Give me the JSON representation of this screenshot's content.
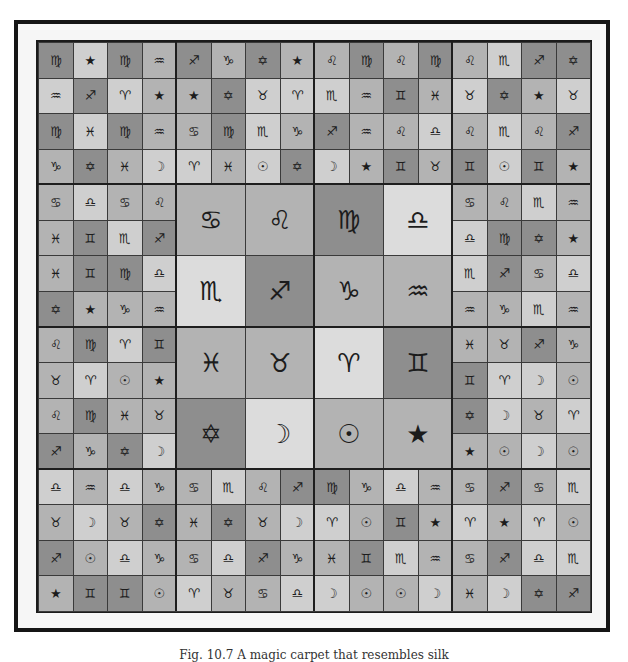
{
  "figure": {
    "credit": "Magick Carpet III   LS  11-03",
    "caption": "Fig. 10.7  A magic carpet that resembles silk"
  },
  "symbols": {
    "aries": "♈",
    "taurus": "♉",
    "gemini": "♊",
    "cancer": "♋",
    "leo": "♌",
    "virgo": "♍",
    "libra": "♎",
    "scorpio": "♏",
    "sagittarius": "♐",
    "capricorn": "♑",
    "aquarius": "♒",
    "pisces": "♓",
    "sun": "☉",
    "moon": "☽",
    "star": "★",
    "hexagram": "✡"
  },
  "grid": {
    "columns": 16,
    "rows": 16,
    "cells": [
      [
        "virgo:dark",
        "star:light",
        "virgo:dark",
        "aquarius:mid",
        "sagittarius:dark",
        "capricorn:mid",
        "hexagram:dark",
        "star:mid",
        "leo:mid",
        "virgo:dark",
        "leo:mid",
        "virgo:dark",
        "leo:mid",
        "scorpio:light",
        "sagittarius:dark",
        "hexagram:dark"
      ],
      [
        "aquarius:light",
        "sagittarius:dark",
        "aries:light",
        "star:mid",
        "star:mid",
        "hexagram:dark",
        "taurus:light",
        "aries:light",
        "scorpio:light",
        "aquarius:mid",
        "gemini:dark",
        "pisces:mid",
        "taurus:light",
        "hexagram:dark",
        "star:mid",
        "taurus:light"
      ],
      [
        "virgo:dark",
        "pisces:light",
        "virgo:dark",
        "aquarius:mid",
        "cancer:mid",
        "virgo:dark",
        "scorpio:light",
        "capricorn:mid",
        "sagittarius:dark",
        "aquarius:mid",
        "leo:mid",
        "libra:light",
        "leo:mid",
        "scorpio:light",
        "leo:mid",
        "sagittarius:dark"
      ],
      [
        "capricorn:mid",
        "hexagram:dark",
        "pisces:mid",
        "moon:light",
        "aries:light",
        "pisces:mid",
        "sun:light",
        "hexagram:dark",
        "moon:light",
        "star:mid",
        "gemini:dark",
        "taurus:mid",
        "gemini:dark",
        "sun:light",
        "gemini:dark",
        "star:mid"
      ],
      [
        "cancer:mid",
        "libra:light",
        "cancer:mid",
        "leo:mid",
        "",
        "",
        "",
        "",
        "",
        "",
        "",
        "",
        "cancer:mid",
        "leo:mid",
        "scorpio:light",
        "aquarius:mid"
      ],
      [
        "pisces:mid",
        "gemini:dark",
        "scorpio:light",
        "sagittarius:dark",
        "",
        "",
        "",
        "",
        "",
        "",
        "",
        "",
        "libra:light",
        "virgo:dark",
        "hexagram:dark",
        "star:mid"
      ],
      [
        "pisces:mid",
        "gemini:dark",
        "virgo:dark",
        "libra:light",
        "",
        "",
        "",
        "",
        "",
        "",
        "",
        "",
        "scorpio:light",
        "sagittarius:dark",
        "cancer:mid",
        "libra:light"
      ],
      [
        "hexagram:dark",
        "star:mid",
        "capricorn:mid",
        "aquarius:mid",
        "",
        "",
        "",
        "",
        "",
        "",
        "",
        "",
        "aquarius:mid",
        "capricorn:mid",
        "scorpio:light",
        "aquarius:mid"
      ],
      [
        "leo:mid",
        "virgo:dark",
        "aries:light",
        "gemini:dark",
        "",
        "",
        "",
        "",
        "",
        "",
        "",
        "",
        "pisces:mid",
        "taurus:mid",
        "sagittarius:dark",
        "capricorn:mid"
      ],
      [
        "taurus:mid",
        "aries:light",
        "sun:mid",
        "star:mid",
        "",
        "",
        "",
        "",
        "",
        "",
        "",
        "",
        "gemini:dark",
        "aries:light",
        "moon:light",
        "sun:mid"
      ],
      [
        "leo:mid",
        "virgo:dark",
        "pisces:mid",
        "taurus:mid",
        "",
        "",
        "",
        "",
        "",
        "",
        "",
        "",
        "hexagram:dark",
        "moon:light",
        "taurus:mid",
        "aries:light"
      ],
      [
        "sagittarius:dark",
        "capricorn:mid",
        "hexagram:dark",
        "moon:light",
        "",
        "",
        "",
        "",
        "",
        "",
        "",
        "",
        "star:mid",
        "sun:mid",
        "moon:light",
        "sun:mid"
      ],
      [
        "libra:light",
        "aquarius:mid",
        "libra:light",
        "capricorn:mid",
        "cancer:mid",
        "scorpio:light",
        "leo:mid",
        "sagittarius:dark",
        "virgo:dark",
        "capricorn:mid",
        "libra:light",
        "aquarius:mid",
        "cancer:mid",
        "sagittarius:dark",
        "cancer:mid",
        "scorpio:light"
      ],
      [
        "taurus:mid",
        "moon:light",
        "taurus:mid",
        "hexagram:dark",
        "pisces:mid",
        "hexagram:dark",
        "taurus:mid",
        "moon:light",
        "aries:light",
        "sun:mid",
        "gemini:dark",
        "star:mid",
        "aries:light",
        "star:mid",
        "aries:light",
        "sun:mid"
      ],
      [
        "sagittarius:dark",
        "sun:mid",
        "libra:light",
        "capricorn:mid",
        "cancer:mid",
        "libra:light",
        "sagittarius:dark",
        "capricorn:mid",
        "pisces:mid",
        "gemini:dark",
        "scorpio:light",
        "aquarius:mid",
        "cancer:mid",
        "sagittarius:dark",
        "libra:light",
        "scorpio:light"
      ],
      [
        "star:mid",
        "gemini:dark",
        "gemini:dark",
        "sun:mid",
        "aries:light",
        "taurus:mid",
        "cancer:mid",
        "libra:light",
        "moon:light",
        "sun:mid",
        "sun:mid",
        "moon:light",
        "pisces:mid",
        "moon:light",
        "hexagram:dark",
        "sagittarius:dark"
      ]
    ],
    "center": [
      [
        "cancer:mid",
        "leo:mid",
        "virgo:dark",
        "libra:vlight"
      ],
      [
        "scorpio:vlight",
        "sagittarius:dark",
        "capricorn:mid",
        "aquarius:mid"
      ],
      [
        "pisces:mid",
        "taurus:mid",
        "aries:vlight",
        "gemini:dark"
      ],
      [
        "hexagram:dark",
        "moon:vlight",
        "sun:mid",
        "star:mid"
      ]
    ]
  }
}
